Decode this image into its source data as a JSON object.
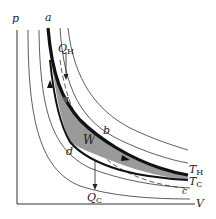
{
  "diagram": {
    "type": "pV-diagram",
    "axes": {
      "y_label": "p",
      "x_label": "V"
    },
    "points": {
      "a": "a",
      "b": "b",
      "c": "c",
      "d": "d"
    },
    "heat_in": {
      "symbol": "Q",
      "subscript": "H"
    },
    "heat_out": {
      "symbol": "Q",
      "subscript": "C"
    },
    "work": "W",
    "isotherms": {
      "hot": {
        "symbol": "T",
        "subscript": "H"
      },
      "cold": {
        "symbol": "T",
        "subscript": "C"
      }
    },
    "colors": {
      "curve": "#222222",
      "cycle_path": "#111111",
      "shaded_work": "#9a9a9a",
      "background": "#ffffff"
    }
  }
}
